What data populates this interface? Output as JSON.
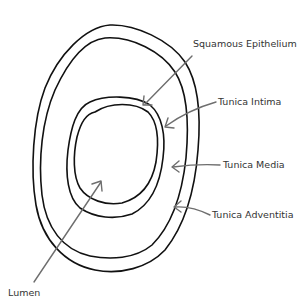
{
  "diagram": {
    "layers": [
      {
        "id": "tunica-adventitia",
        "label": "Tunica Adventitia"
      },
      {
        "id": "tunica-media",
        "label": "Tunica Media"
      },
      {
        "id": "tunica-intima",
        "label": "Tunica Intima"
      },
      {
        "id": "squamous-epithelium",
        "label": "Squamous Epithelium"
      },
      {
        "id": "lumen",
        "label": "Lumen"
      }
    ],
    "labels": {
      "squamous_epithelium": "Squamous Epithelium",
      "tunica_intima": "Tunica Intima",
      "tunica_media": "Tunica Media",
      "tunica_adventitia": "Tunica Adventitia",
      "lumen": "Lumen"
    },
    "colors": {
      "outline": "#111111",
      "arrow": "#6e6e6e",
      "text": "#333333",
      "background": "#ffffff"
    }
  }
}
